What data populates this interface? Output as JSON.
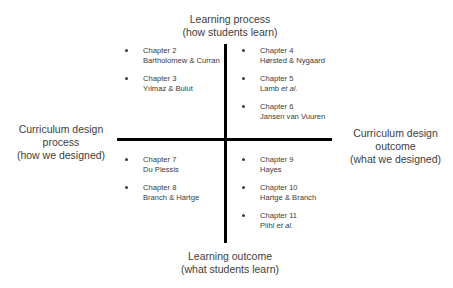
{
  "axes": {
    "top": {
      "line1": "Learning process",
      "line2": "(how students learn)"
    },
    "bottom": {
      "line1": "Learning outcome",
      "line2": "(what students learn)"
    },
    "left": {
      "line1": "Curriculum design",
      "line2": "process",
      "line3": "(how we designed)"
    },
    "right": {
      "line1": "Curriculum design",
      "line2": "outcome",
      "line3": "(what we designed)"
    }
  },
  "quadrants": {
    "top_left": [
      {
        "chapter": "Chapter 2",
        "authors": "Bartholomew & Curran",
        "etal": ""
      },
      {
        "chapter": "Chapter 3",
        "authors": "Yılmaz & Bulut",
        "etal": ""
      }
    ],
    "top_right": [
      {
        "chapter": "Chapter 4",
        "authors": "Hørsted & Nygaard",
        "etal": ""
      },
      {
        "chapter": "Chapter 5",
        "authors": "Lamb ",
        "etal": "et al."
      },
      {
        "chapter": "Chapter 6",
        "authors": "Jansen van Vuuren",
        "etal": ""
      }
    ],
    "bottom_left": [
      {
        "chapter": "Chapter 7",
        "authors": "Du Plessis",
        "etal": ""
      },
      {
        "chapter": "Chapter 8",
        "authors": "Branch & Hartge",
        "etal": ""
      }
    ],
    "bottom_right": [
      {
        "chapter": "Chapter 9",
        "authors": "Hayes",
        "etal": ""
      },
      {
        "chapter": "Chapter 10",
        "authors": "Hartge & Branch",
        "etal": ""
      },
      {
        "chapter": "Chapter 11",
        "authors": "Piihl ",
        "etal": "et al."
      }
    ]
  }
}
